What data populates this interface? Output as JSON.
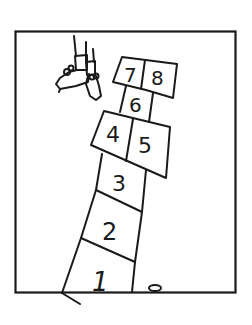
{
  "illustration": {
    "subject": "hopscotch",
    "squares": [
      {
        "label": "1"
      },
      {
        "label": "2"
      },
      {
        "label": "3"
      },
      {
        "label": "4"
      },
      {
        "label": "5"
      },
      {
        "label": "6"
      },
      {
        "label": "7"
      },
      {
        "label": "8"
      }
    ],
    "colors": {
      "ink": "#1a1a1a",
      "background": "#ffffff"
    }
  }
}
